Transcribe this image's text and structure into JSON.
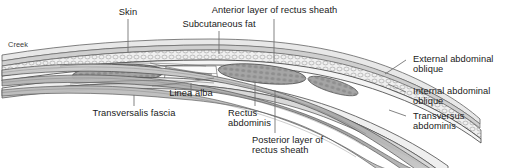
{
  "figure": {
    "kind": "anatomical-cross-section",
    "credit": "Creek",
    "background_color": "#ffffff",
    "ink_color": "#1a1a1a",
    "leader_color": "#555555",
    "fill_light": "#f2f2f2",
    "fill_mid": "#c9c9c9",
    "fill_dark": "#9a9a9a",
    "muscle_fill": "#a8a8a8",
    "fat_fill": "#e2e2e2"
  },
  "labels": {
    "skin": "Skin",
    "subcutaneous_fat": "Subcutaneous fat",
    "anterior_layer_rectus_sheath": "Anterior layer of rectus sheath",
    "external_abdominal_oblique_line1": "External abdominal",
    "external_abdominal_oblique_line2": "oblique",
    "internal_abdominal_oblique_line1": "Internal abdominal",
    "internal_abdominal_oblique_line2": "oblique",
    "transversus_abdominis_line1": "Transversus",
    "transversus_abdominis_line2": "abdominis",
    "linea_alba": "Linea alba",
    "transversalis_fascia": "Transversalis fascia",
    "rectus_abdominis_line1": "Rectus",
    "rectus_abdominis_line2": "abdominis",
    "posterior_layer_rectus_sheath_line1": "Posterior layer of",
    "posterior_layer_rectus_sheath_line2": "rectus sheath",
    "credit": "Creek"
  }
}
